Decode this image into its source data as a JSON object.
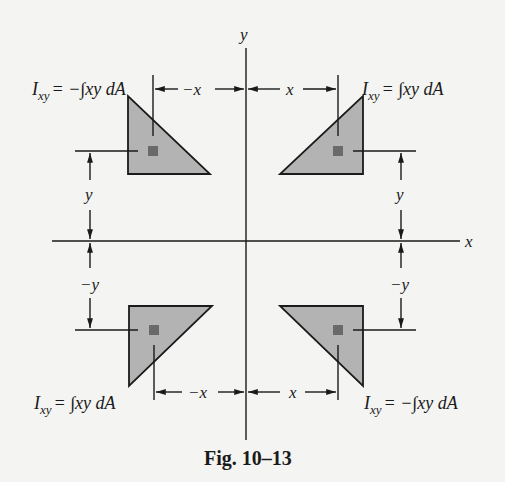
{
  "figure": {
    "caption": "Fig. 10–13",
    "axes": {
      "x_label": "x",
      "y_label": "y"
    },
    "quadrants": [
      {
        "position": "top-left",
        "formula_lhs": "I",
        "formula_sub": "xy",
        "formula_rhs": "= −∫xy dA",
        "x_dim": "−x",
        "y_dim": "y"
      },
      {
        "position": "top-right",
        "formula_lhs": "I",
        "formula_sub": "xy",
        "formula_rhs": "= ∫xy dA",
        "x_dim": "x",
        "y_dim": "y"
      },
      {
        "position": "bottom-left",
        "formula_lhs": "I",
        "formula_sub": "xy",
        "formula_rhs": "= ∫xy dA",
        "x_dim": "−x",
        "y_dim": "−y"
      },
      {
        "position": "bottom-right",
        "formula_lhs": "I",
        "formula_sub": "xy",
        "formula_rhs": "= −∫xy dA",
        "x_dim": "x",
        "y_dim": "−y"
      }
    ],
    "colors": {
      "shape_fill": "#b3b3b3",
      "element_fill": "#6a6a6a",
      "line": "#1a1a1a"
    }
  }
}
